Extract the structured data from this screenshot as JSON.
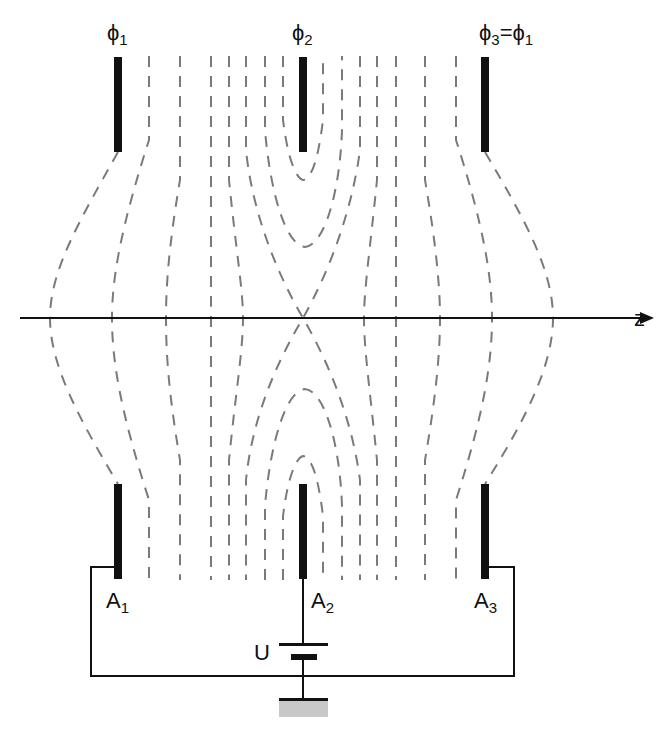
{
  "diagram": {
    "type": "electrostatic lens (einzel lens) equipotential diagram",
    "axis": {
      "label": "z"
    },
    "potentials": [
      {
        "symbol": "ϕ",
        "sub": "1",
        "x": 118
      },
      {
        "symbol": "ϕ",
        "sub": "2",
        "x": 303
      },
      {
        "symbol": "ϕ",
        "sub": "3",
        "equals": "ϕ",
        "equals_sub": "1",
        "x": 485
      }
    ],
    "electrodes": [
      {
        "name": "A",
        "sub": "1"
      },
      {
        "name": "A",
        "sub": "2"
      },
      {
        "name": "A",
        "sub": "3"
      }
    ],
    "source": {
      "label": "U"
    },
    "colors": {
      "electrode": "#111111",
      "equipotential": "#7a7a7a",
      "ground": "#c8c8c8"
    }
  }
}
